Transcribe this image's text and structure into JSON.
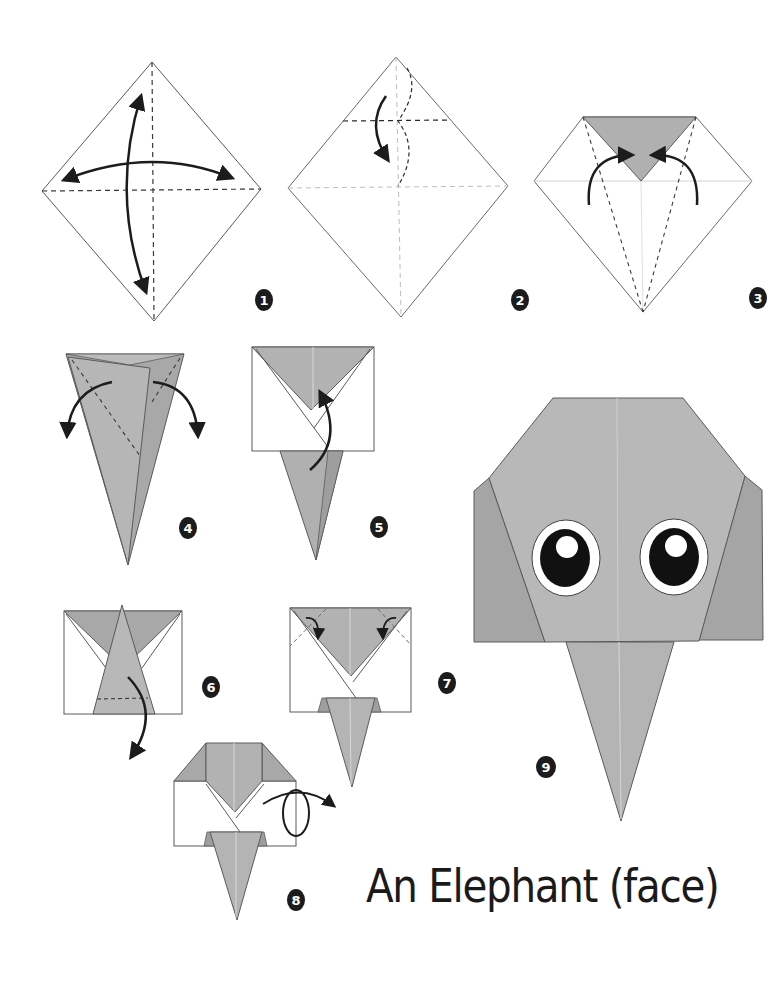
{
  "title": "An Elephant (face)",
  "colors": {
    "paper_gray": "#b4b4b4",
    "paper_dark": "#a3a3a3",
    "paper_white": "#ffffff",
    "stroke": "#4a4a4a",
    "arrow": "#1c1c1c",
    "badge": "#1c1c1c",
    "eye_black": "#111111"
  },
  "steps": [
    {
      "number": "1",
      "description": "Square on point; fold and unfold both diagonals"
    },
    {
      "number": "2",
      "description": "Fold top corner down to center (valley), then unfold"
    },
    {
      "number": "3",
      "description": "Fold both sides to the center line"
    },
    {
      "number": "4",
      "description": "Fold the flaps out to the sides"
    },
    {
      "number": "5",
      "description": "Fold the point up"
    },
    {
      "number": "6",
      "description": "Fold the tip down along dashed line"
    },
    {
      "number": "7",
      "description": "Fold top corners inward"
    },
    {
      "number": "8",
      "description": "Turn the model over"
    },
    {
      "number": "9",
      "description": "Finished elephant face with eyes"
    }
  ]
}
